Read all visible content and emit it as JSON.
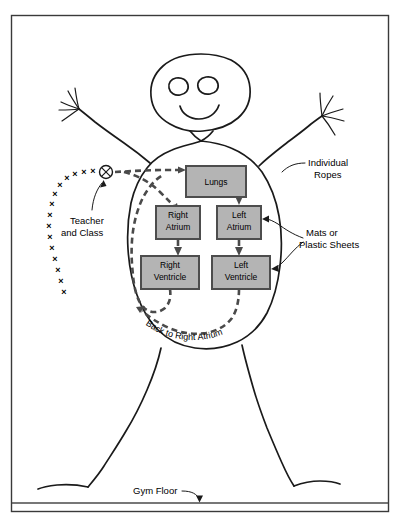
{
  "figure": {
    "background_color": "#ffffff",
    "border_color": "#3a3a3a",
    "ink_color": "#1a1a1a",
    "box_fill_color": "#b4b4b4",
    "box_border_color": "#4d4d4d",
    "flow_color": "#4a4a4a"
  },
  "stations": [
    {
      "id": "lungs",
      "label": "Lungs",
      "line1": "Lungs",
      "line2": "",
      "x": 186,
      "y": 166,
      "w": 60,
      "h": 31
    },
    {
      "id": "right-atrium",
      "label": "Right Atrium",
      "line1": "Right",
      "line2": "Atrium",
      "x": 156,
      "y": 206,
      "w": 44,
      "h": 33
    },
    {
      "id": "left-atrium",
      "label": "Left Atrium",
      "line1": "Left",
      "line2": "Atrium",
      "x": 217,
      "y": 206,
      "w": 44,
      "h": 33
    },
    {
      "id": "right-ventricle",
      "label": "Right Ventricle",
      "line1": "Right",
      "line2": "Ventricle",
      "x": 141,
      "y": 256,
      "w": 58,
      "h": 33
    },
    {
      "id": "left-ventricle",
      "label": "Left Ventricle",
      "line1": "Left",
      "line2": "Ventricle",
      "x": 212,
      "y": 256,
      "w": 58,
      "h": 33
    }
  ],
  "annotations": [
    {
      "id": "individual-ropes",
      "line1": "Individual",
      "line2": "Ropes",
      "x": 310,
      "y": 160
    },
    {
      "id": "mats-or-sheets",
      "line1": "Mats or",
      "line2": "Plastic Sheets",
      "x": 307,
      "y": 233
    },
    {
      "id": "teacher-class",
      "line1": "Teacher",
      "line2": "and Class",
      "x": 70,
      "y": 221
    },
    {
      "id": "gym-floor",
      "line1": "Gym Floor",
      "line2": "",
      "x": 133,
      "y": 493
    }
  ],
  "flow_label": {
    "id": "back-to-right-atrium",
    "text": "Back to Right Atrium"
  },
  "flow_sequence": [
    "Teacher and Class",
    "Lungs",
    "Left Atrium",
    "Left Ventricle",
    "Back to Right Atrium",
    "Right Atrium",
    "Right Ventricle"
  ],
  "teacher_marker": {
    "id": "teacher-symbol",
    "glyph": "circled-x"
  },
  "class_marks": {
    "glyph": "x",
    "count": 15,
    "points": [
      [
        118,
        173
      ],
      [
        108,
        174
      ],
      [
        98,
        176
      ],
      [
        88,
        178
      ],
      [
        79,
        181
      ],
      [
        71,
        186
      ],
      [
        64,
        193
      ],
      [
        59,
        202
      ],
      [
        55,
        212
      ],
      [
        52,
        222
      ],
      [
        50,
        233
      ],
      [
        49,
        245
      ],
      [
        50,
        257
      ],
      [
        52,
        268
      ],
      [
        55,
        279
      ]
    ]
  }
}
